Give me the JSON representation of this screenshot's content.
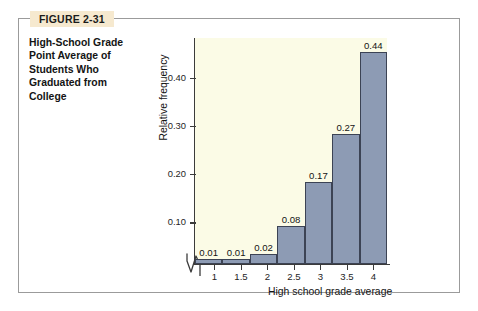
{
  "figure": {
    "badge": "FIGURE 2-31",
    "caption": "High-School Grade Point Average of Students Who Graduated from College"
  },
  "colors": {
    "bar_fill": "#8d9bb4",
    "bar_stroke": "#3c4354",
    "plot_background": "#fbfbe6",
    "badge_background": "#f6e9cf",
    "frame_border": "#9b9b9b",
    "axis": "#3b3b3b"
  },
  "chart_data": {
    "type": "bar",
    "title": "High-School Grade Point Average of Students Who Graduated from College",
    "subtitle": "",
    "xlabel": "High school grade average",
    "ylabel": "Relative frequency",
    "categories": [
      "1",
      "1.5",
      "2",
      "2.5",
      "3",
      "3.5",
      "4"
    ],
    "values": [
      0.01,
      0.01,
      0.02,
      0.08,
      0.17,
      0.27,
      0.44
    ],
    "data_labels": [
      "0.01",
      "0.01",
      "0.02",
      "0.08",
      "0.17",
      "0.27",
      "0.44"
    ],
    "xtick_labels": [
      "1",
      "1.5",
      "2",
      "2.5",
      "3",
      "3.5",
      "4"
    ],
    "ytick_labels": [
      "0.10",
      "0.20",
      "0.30",
      "0.40"
    ],
    "ytick_values": [
      0.1,
      0.2,
      0.3,
      0.4
    ],
    "ylim": [
      0,
      0.47
    ],
    "xlim": [
      0.75,
      4.25
    ],
    "bin_width": 0.5,
    "grid": false,
    "legend": false,
    "axis_break_x": true
  }
}
